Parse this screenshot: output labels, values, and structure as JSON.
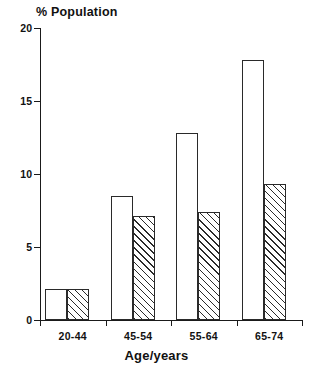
{
  "chart_data": {
    "type": "bar",
    "title": "",
    "xlabel": "Age/years",
    "ylabel": "% Population",
    "categories": [
      "20-44",
      "45-54",
      "55-64",
      "65-74"
    ],
    "ylim": [
      0,
      20
    ],
    "yticks": [
      0,
      5,
      10,
      15,
      20
    ],
    "ytick_labels": [
      "0",
      "5",
      "10",
      "15",
      "20"
    ],
    "grid": false,
    "legend": "none",
    "series": [
      {
        "name": "open-bar",
        "style": "unfilled",
        "values": [
          2.1,
          8.5,
          12.8,
          17.8
        ]
      },
      {
        "name": "hatched-bar",
        "style": "diagonal-hatch",
        "values": [
          2.1,
          7.1,
          7.4,
          9.3
        ]
      }
    ]
  }
}
